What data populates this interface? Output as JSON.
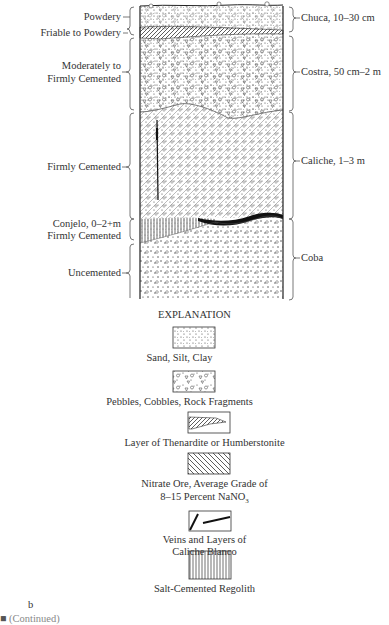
{
  "column": {
    "left_labels": {
      "powdery": "Powdery",
      "friable": "Friable to Powdery",
      "moderately_1": "Moderately to",
      "moderately_2": "Firmly Cemented",
      "firmly": "Firmly Cemented",
      "conjelo_1": "Conjelo, 0–2+m",
      "conjelo_2": "Firmly Cemented",
      "uncemented": "Uncemented"
    },
    "right_labels": {
      "chuca": "Chuca, 10–30 cm",
      "costra": "Costra, 50 cm–2 m",
      "caliche": "Caliche, 1–3 m",
      "coba": "Coba"
    }
  },
  "explanation": {
    "title": "EXPLANATION",
    "items": [
      {
        "icon": "sand-silt-clay-pattern-icon",
        "label": "Sand, Silt, Clay"
      },
      {
        "icon": "pebbles-pattern-icon",
        "label": "Pebbles, Cobbles, Rock Fragments"
      },
      {
        "icon": "thenardite-layer-icon",
        "label": "Layer of Thenardite or Humberstonite"
      },
      {
        "icon": "nitrate-ore-hatch-icon",
        "label_1": "Nitrate Ore, Average Grade of",
        "label_2": "8–15 Percent NaNO",
        "label_2_sub": "3"
      },
      {
        "icon": "caliche-blanco-veins-icon",
        "label_1": "Veins and Layers of",
        "label_2": "Caliche Blanco"
      },
      {
        "icon": "salt-regolith-pattern-icon",
        "label": "Salt-Cemented Regolith"
      }
    ]
  },
  "panel_label": "b",
  "caption_fragment": "(Continued)"
}
